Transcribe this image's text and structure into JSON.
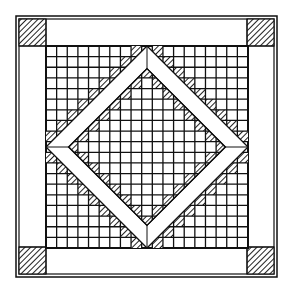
{
  "colors": {
    "line": "#111111",
    "background": "#ffffff",
    "hatch": "#222222"
  },
  "block": {
    "outer": {
      "x": 16,
      "y": 16,
      "size": 261
    },
    "inner_border": {
      "x": 19,
      "y": 19,
      "size": 255
    },
    "corner_size": 27,
    "grid": {
      "x": 46,
      "y": 46,
      "size": 202,
      "cells": 19
    },
    "diamond": {
      "cx": 147,
      "cy": 147,
      "outer_half": 101,
      "band_width": 16
    }
  },
  "components": {
    "corner_squares": [
      "top-left",
      "top-right",
      "bottom-left",
      "bottom-right"
    ],
    "sashing_strips": [
      "top",
      "right",
      "bottom",
      "left"
    ],
    "center": "checkerboard grid with diamond frame and hatched sawtooth squares"
  }
}
